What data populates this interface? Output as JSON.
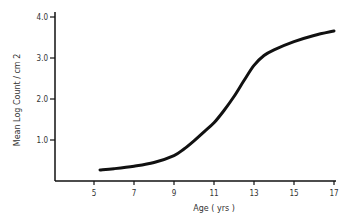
{
  "chart_data": {
    "type": "line",
    "title": "",
    "xlabel": "Age ( yrs )",
    "ylabel": "Mean Log  Count / cm 2",
    "xlim": [
      3,
      17
    ],
    "ylim": [
      0,
      4.0
    ],
    "xticks": [
      5,
      7,
      9,
      11,
      13,
      15,
      17
    ],
    "xtick_labels": [
      "5",
      "7",
      "9",
      "11",
      "13",
      "15",
      "17"
    ],
    "yticks": [
      1.0,
      2.0,
      3.0,
      4.0
    ],
    "ytick_labels": [
      "1.0",
      "2.0",
      "3.0",
      "4.0"
    ],
    "grid": false,
    "legend": null,
    "series": [
      {
        "name": "Mean Log Count",
        "x": [
          5.3,
          6,
          7,
          8,
          9,
          9.5,
          10,
          10.5,
          11,
          11.5,
          12,
          12.5,
          13,
          13.5,
          14,
          15,
          16,
          17
        ],
        "y": [
          0.27,
          0.3,
          0.36,
          0.45,
          0.62,
          0.78,
          0.98,
          1.2,
          1.42,
          1.72,
          2.06,
          2.45,
          2.82,
          3.06,
          3.2,
          3.4,
          3.55,
          3.66
        ]
      }
    ]
  }
}
